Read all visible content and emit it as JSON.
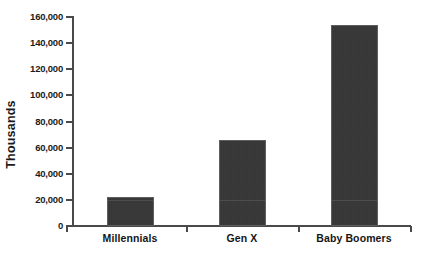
{
  "chart_data": {
    "type": "bar",
    "title": "",
    "subtitle": "",
    "xlabel": "",
    "ylabel": "Thousands",
    "categories": [
      "Millennials",
      "Gen X",
      "Baby Boomers"
    ],
    "values": [
      22000,
      66000,
      154000
    ],
    "series": [
      {
        "name": "Population",
        "values": [
          22000,
          66000,
          154000
        ]
      }
    ],
    "ylim": [
      0,
      160000
    ],
    "ytick_labels": [
      "0",
      "20,000",
      "40,000",
      "60,000",
      "80,000",
      "100,000",
      "120,000",
      "140,000",
      "160,000"
    ],
    "ytick_values": [
      0,
      20000,
      40000,
      60000,
      80000,
      100000,
      120000,
      140000,
      160000
    ],
    "grid": false,
    "legend": false,
    "legend_position": "none",
    "bar_color": "#343434",
    "axis_color": "#4a4a4a",
    "text_color": "#1b1b1b",
    "background_color": "#ffffff"
  }
}
